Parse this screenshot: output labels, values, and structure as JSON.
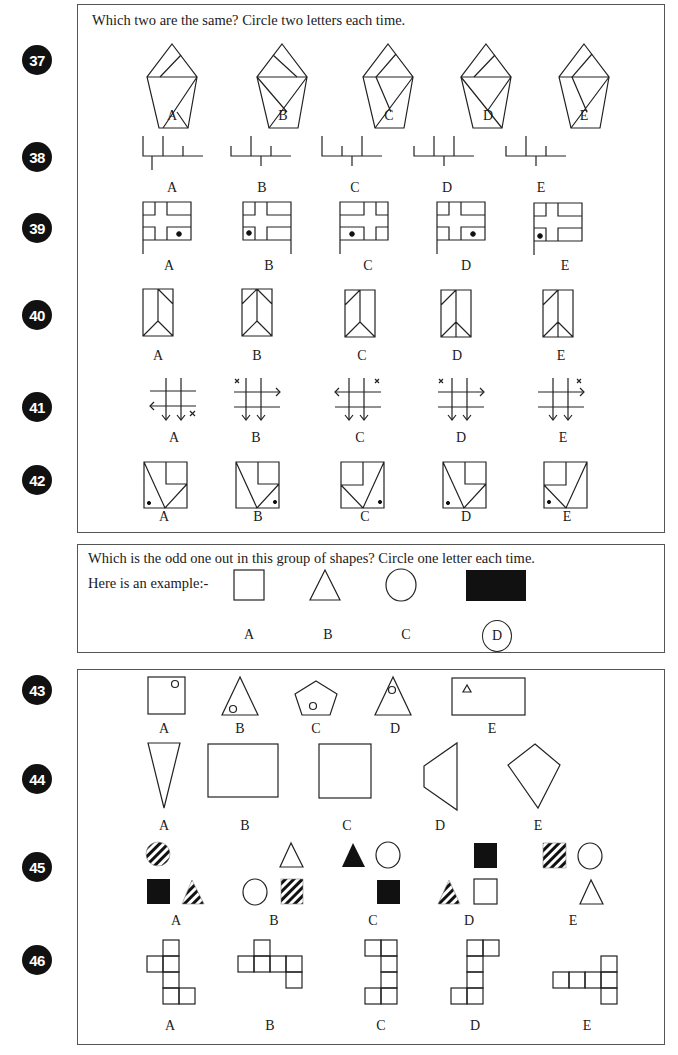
{
  "section1": {
    "instruction": "Which two are the same? Circle two letters each time.",
    "questions": [
      {
        "number": "37",
        "options": [
          "A",
          "B",
          "C",
          "D",
          "E"
        ],
        "figure_type": "pentagon-with-lines"
      },
      {
        "number": "38",
        "options": [
          "A",
          "B",
          "C",
          "D",
          "E"
        ],
        "figure_type": "branched-lines"
      },
      {
        "number": "39",
        "options": [
          "A",
          "B",
          "C",
          "D",
          "E"
        ],
        "figure_type": "grid-with-dot"
      },
      {
        "number": "40",
        "options": [
          "A",
          "B",
          "C",
          "D",
          "E"
        ],
        "figure_type": "rectangle-with-lines"
      },
      {
        "number": "41",
        "options": [
          "A",
          "B",
          "C",
          "D",
          "E"
        ],
        "figure_type": "hash-grid-with-arrows"
      },
      {
        "number": "42",
        "options": [
          "A",
          "B",
          "C",
          "D",
          "E"
        ],
        "figure_type": "square-with-notch-and-dot",
        "labels_above": [
          "A",
          "B",
          "C",
          "D",
          "E"
        ]
      }
    ]
  },
  "example": {
    "instruction": "Which is the odd one out in this group of shapes? Circle one letter each time.",
    "example_label": "Here is an example:-",
    "options": [
      "A",
      "B",
      "C",
      "D"
    ],
    "shapes": [
      "square-outline",
      "triangle-outline",
      "circle-outline",
      "rectangle-filled"
    ],
    "answer": "D"
  },
  "section2": {
    "questions": [
      {
        "number": "43",
        "options": [
          "A",
          "B",
          "C",
          "D",
          "E"
        ],
        "figure_type": "shape-with-small-shape"
      },
      {
        "number": "44",
        "options": [
          "A",
          "B",
          "C",
          "D",
          "E"
        ],
        "figure_type": "quadrilaterals"
      },
      {
        "number": "45",
        "options": [
          "A",
          "B",
          "C",
          "D",
          "E"
        ],
        "figure_type": "shaded-shape-groups"
      },
      {
        "number": "46",
        "options": [
          "A",
          "B",
          "C",
          "D",
          "E"
        ],
        "figure_type": "square-polyominoes"
      }
    ]
  },
  "colors": {
    "ink": "#111111",
    "border": "#555555",
    "background": "#ffffff"
  }
}
